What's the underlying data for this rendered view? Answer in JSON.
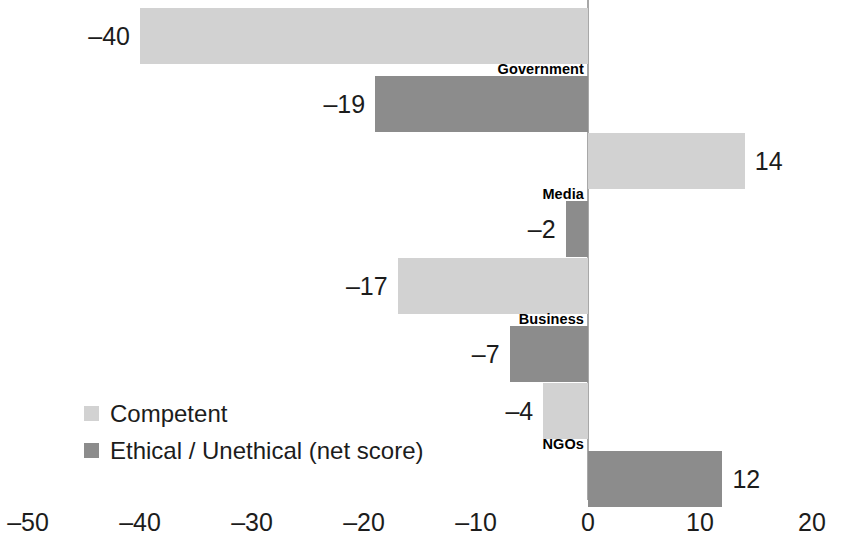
{
  "chart_data": {
    "type": "bar",
    "orientation": "horizontal",
    "title": "",
    "subtitle": "",
    "xlabel": "",
    "ylabel": "",
    "xlim": [
      -50,
      20
    ],
    "xticks": [
      -50,
      -40,
      -30,
      -20,
      -10,
      0,
      10,
      20
    ],
    "xtick_labels": [
      "–50",
      "–40",
      "–30",
      "–20",
      "–10",
      "0",
      "10",
      "20"
    ],
    "grid": false,
    "zero_line": true,
    "legend_position": "bottom-left",
    "categories": [
      "Government",
      "Media",
      "Business",
      "NGOs"
    ],
    "series": [
      {
        "name": "Competent",
        "color": "#d2d2d2",
        "values": [
          -40,
          14,
          -17,
          -4
        ],
        "value_labels": [
          "–40",
          "14",
          "–17",
          "–4"
        ]
      },
      {
        "name": "Ethical / Unethical (net score)",
        "color": "#8c8c8c",
        "values": [
          -19,
          -2,
          -7,
          12
        ],
        "value_labels": [
          "–19",
          "–2",
          "–7",
          "12"
        ]
      }
    ]
  },
  "legend": {
    "items": [
      {
        "label": "Competent",
        "swatch_class": "series-competent"
      },
      {
        "label": "Ethical / Unethical (net score)",
        "swatch_class": "series-ethical"
      }
    ]
  },
  "axis": {
    "zero_line_color": "#a8a8a8"
  }
}
